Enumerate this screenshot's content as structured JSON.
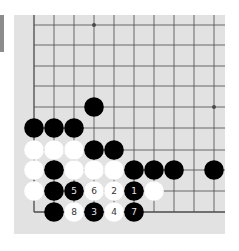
{
  "board": {
    "background": "#e2e2e2",
    "line_color": "#4a4a4a",
    "black_color": "#000000",
    "white_color": "#ffffff",
    "columns_x": [
      34,
      54,
      74,
      94,
      114,
      134,
      154,
      174,
      194,
      214
    ],
    "rows_y": [
      25,
      45,
      66,
      86,
      107,
      128,
      150,
      170,
      191,
      212
    ],
    "edges": {
      "left": true,
      "bottom": true,
      "top": false,
      "right": false
    },
    "star_points": [
      [
        3,
        0
      ],
      [
        9,
        4
      ]
    ],
    "stones": [
      {
        "col": 3,
        "row": 4,
        "color": "black"
      },
      {
        "col": 0,
        "row": 5,
        "color": "black"
      },
      {
        "col": 1,
        "row": 5,
        "color": "black"
      },
      {
        "col": 2,
        "row": 5,
        "color": "black"
      },
      {
        "col": 0,
        "row": 6,
        "color": "white"
      },
      {
        "col": 1,
        "row": 6,
        "color": "white"
      },
      {
        "col": 2,
        "row": 6,
        "color": "white"
      },
      {
        "col": 3,
        "row": 6,
        "color": "black"
      },
      {
        "col": 4,
        "row": 6,
        "color": "black"
      },
      {
        "col": 0,
        "row": 7,
        "color": "white"
      },
      {
        "col": 1,
        "row": 7,
        "color": "black"
      },
      {
        "col": 2,
        "row": 7,
        "color": "white"
      },
      {
        "col": 3,
        "row": 7,
        "color": "white"
      },
      {
        "col": 4,
        "row": 7,
        "color": "white"
      },
      {
        "col": 5,
        "row": 7,
        "color": "black"
      },
      {
        "col": 6,
        "row": 7,
        "color": "black"
      },
      {
        "col": 7,
        "row": 7,
        "color": "black"
      },
      {
        "col": 9,
        "row": 7,
        "color": "black"
      },
      {
        "col": 0,
        "row": 8,
        "color": "white"
      },
      {
        "col": 1,
        "row": 8,
        "color": "black"
      },
      {
        "col": 2,
        "row": 8,
        "color": "black",
        "label": "5"
      },
      {
        "col": 3,
        "row": 8,
        "color": "white",
        "label": "6"
      },
      {
        "col": 4,
        "row": 8,
        "color": "white",
        "label": "2"
      },
      {
        "col": 5,
        "row": 8,
        "color": "black",
        "label": "1"
      },
      {
        "col": 6,
        "row": 8,
        "color": "white"
      },
      {
        "col": 1,
        "row": 9,
        "color": "black"
      },
      {
        "col": 2,
        "row": 9,
        "color": "white",
        "label": "8"
      },
      {
        "col": 3,
        "row": 9,
        "color": "black",
        "label": "3"
      },
      {
        "col": 4,
        "row": 9,
        "color": "white",
        "label": "4"
      },
      {
        "col": 5,
        "row": 9,
        "color": "black",
        "label": "7"
      }
    ]
  }
}
